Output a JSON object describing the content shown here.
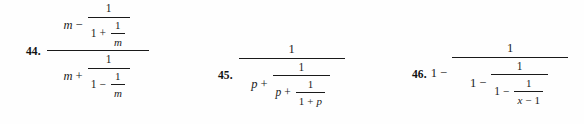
{
  "page": {
    "background_color": "#fefefe",
    "text_color": "#1a1a1a",
    "kind": "math-textbook-exercise-row"
  },
  "exercises": [
    {
      "number": "44.",
      "expression_text": "(m - 1/(1 + 1/m)) / (m + 1/(1 - 1/m))",
      "numerator": {
        "lead_var": "m",
        "operator": "−",
        "fraction": {
          "numerator": "1",
          "denominator": {
            "lead": "1",
            "operator": "+",
            "fraction": {
              "numerator": "1",
              "denominator": "m"
            }
          }
        }
      },
      "denominator": {
        "lead_var": "m",
        "operator": "+",
        "fraction": {
          "numerator": "1",
          "denominator": {
            "lead": "1",
            "operator": "−",
            "fraction": {
              "numerator": "1",
              "denominator": "m"
            }
          }
        }
      }
    },
    {
      "number": "45.",
      "expression_text": "1 / (p + 1/(p + 1/(1 + p)))",
      "numerator": "1",
      "denominator": {
        "lead_var": "p",
        "operator": "+",
        "fraction": {
          "numerator": "1",
          "denominator": {
            "lead_var": "p",
            "operator": "+",
            "fraction": {
              "numerator": "1",
              "denominator": {
                "left": "1",
                "operator": "+",
                "right": "p"
              }
            }
          }
        }
      }
    },
    {
      "number": "46.",
      "expression_text": "1 - 1/(1 - 1/(1 - 1/(x - 1)))",
      "lead": "1",
      "lead_operator": "−",
      "fraction": {
        "numerator": "1",
        "denominator": {
          "lead": "1",
          "operator": "−",
          "fraction": {
            "numerator": "1",
            "denominator": {
              "lead": "1",
              "operator": "−",
              "fraction": {
                "numerator": "1",
                "denominator": {
                  "left": "x",
                  "operator": "−",
                  "right": "1"
                }
              }
            }
          }
        }
      }
    }
  ]
}
